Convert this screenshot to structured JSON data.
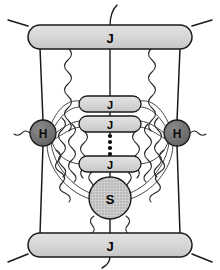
{
  "figure": {
    "width": 220,
    "height": 270,
    "background_color": "#ffffff"
  },
  "colors": {
    "jet_fill": "#d7d7d7",
    "jet_stroke": "#1a1a1a",
    "hard_fill": "#6e6e6e",
    "hard_stroke": "#1a1a1a",
    "soft_fill": "#c9c9c9",
    "soft_stroke": "#1a1a1a",
    "line": "#1a1a1a",
    "gluon": "#333333",
    "label_dark": "#000000"
  },
  "nodes": {
    "jet_top": {
      "label": "J",
      "role": "outgoing-jet-function",
      "cx": 110,
      "cy": 38
    },
    "jet_bottom": {
      "label": "J",
      "role": "outgoing-jet-function",
      "cx": 110,
      "cy": 245
    },
    "jet_inner_1": {
      "label": "J",
      "role": "collinear-jet-function",
      "cx": 110,
      "cy": 104
    },
    "jet_inner_2": {
      "label": "J",
      "role": "collinear-jet-function",
      "cx": 110,
      "cy": 124
    },
    "jet_inner_3": {
      "label": "J",
      "role": "collinear-jet-function",
      "cx": 110,
      "cy": 164
    },
    "hard_left": {
      "label": "H",
      "role": "hard-vertex",
      "cx": 43,
      "cy": 133,
      "r": 13
    },
    "hard_right": {
      "label": "H",
      "role": "hard-vertex",
      "cx": 177,
      "cy": 133,
      "r": 13
    },
    "soft": {
      "label": "S",
      "role": "soft-function",
      "cx": 110,
      "cy": 198,
      "r": 21
    }
  },
  "ellipsis": {
    "name": "vertical-ellipsis",
    "dot_count": 4,
    "cx": 110,
    "y_start": 135,
    "y_step": 6
  },
  "icons": {
    "gluon": "wavy-gluon-line",
    "eikonal": "straight-eikonal-line",
    "arc": "curved-connector-arc",
    "ellipsis": "vertical-dots-icon"
  },
  "counts": {
    "outer_jets": 2,
    "inner_jets": 3,
    "hard_vertices": 2,
    "soft_blobs": 1
  }
}
